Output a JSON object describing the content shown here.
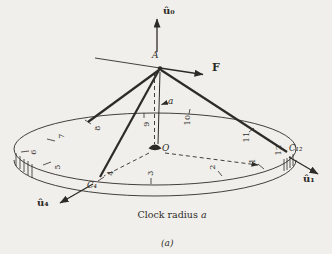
{
  "diagram": {
    "point_labels": {
      "apex": "A",
      "center": "O"
    },
    "force_label": "F",
    "height_label": "a",
    "unit_vectors": {
      "up": "û₀",
      "right": "û₁",
      "left": "û₄"
    },
    "attachment_points": {
      "c4": "C₄",
      "c12": "C₁₂"
    },
    "clock_numbers": [
      "1",
      "2",
      "3",
      "4",
      "5",
      "6",
      "7",
      "8",
      "9",
      "10",
      "11",
      "12"
    ],
    "caption": {
      "text": "Clock radius ",
      "var": "a"
    },
    "subfigure_label": "(a)",
    "colors": {
      "ink": "#2d2b28",
      "paper": "#f1efeb"
    }
  }
}
